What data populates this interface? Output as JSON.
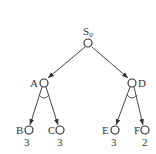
{
  "diagram": {
    "type": "AND-OR tree",
    "root": {
      "id": "S0",
      "label": "S",
      "subscript": "0"
    },
    "nodes": [
      {
        "id": "S0",
        "label": "S₀",
        "value": null
      },
      {
        "id": "A",
        "label": "A",
        "value": null,
        "and_node": true
      },
      {
        "id": "D",
        "label": "D",
        "value": null,
        "and_node": true
      },
      {
        "id": "B",
        "label": "B",
        "value": "3"
      },
      {
        "id": "C",
        "label": "C",
        "value": "3"
      },
      {
        "id": "E",
        "label": "E",
        "value": "3"
      },
      {
        "id": "F",
        "label": "F",
        "value": "2"
      }
    ],
    "edges": [
      {
        "from": "S0",
        "to": "A"
      },
      {
        "from": "S0",
        "to": "D"
      },
      {
        "from": "A",
        "to": "B"
      },
      {
        "from": "A",
        "to": "C"
      },
      {
        "from": "D",
        "to": "E"
      },
      {
        "from": "D",
        "to": "F"
      }
    ],
    "labels": {
      "S0_main": "S",
      "S0_sub": "0",
      "A": "A",
      "D": "D",
      "B": "B",
      "C": "C",
      "E": "E",
      "F": "F"
    },
    "values": {
      "B": "3",
      "C": "3",
      "E": "3",
      "F": "2"
    }
  }
}
